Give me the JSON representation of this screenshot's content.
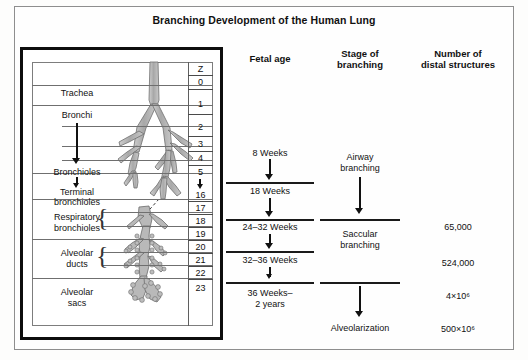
{
  "figure": {
    "title": "Branching Development of the Human Lung"
  },
  "left_panel": {
    "z_header": "Z",
    "airway_labels": [
      {
        "text": "Trachea"
      },
      {
        "text": "Bronchi"
      },
      {
        "text": "Bronchioles"
      },
      {
        "text": "Terminal\nbronchioles"
      },
      {
        "text": "Respiratory\nbronchioles"
      },
      {
        "text": "Alveolar\nducts"
      },
      {
        "text": "Alveolar\nsacs"
      }
    ],
    "label_trachea": "Trachea",
    "label_bronchi": "Bronchi",
    "label_bronchioles": "Bronchioles",
    "label_terminal_1": "Terminal",
    "label_terminal_2": "bronchioles",
    "label_resp_1": "Respiratory",
    "label_resp_2": "bronchioles",
    "label_ducts_1": "Alveolar",
    "label_ducts_2": "ducts",
    "label_sacs_1": "Alveolar",
    "label_sacs_2": "sacs",
    "generations": [
      "0",
      "1",
      "2",
      "3",
      "4",
      "5",
      "16",
      "17",
      "18",
      "19",
      "20",
      "21",
      "22",
      "23"
    ],
    "generation_gap_marker": "arrow-down-icon"
  },
  "columns": {
    "fetal_age_header": "Fetal age",
    "stage_header_line1": "Stage of",
    "stage_header_line2": "branching",
    "number_header_line1": "Number of",
    "number_header_line2": "distal structures"
  },
  "fetal_ages": [
    {
      "label": "8 Weeks"
    },
    {
      "label": "18 Weeks"
    },
    {
      "label": "24–32 Weeks"
    },
    {
      "label": "32–36 Weeks"
    },
    {
      "label": "36 Weeks–",
      "label2": "2 years"
    }
  ],
  "stages": [
    {
      "line1": "Airway",
      "line2": "branching"
    },
    {
      "line1": "Saccular",
      "line2": "branching"
    },
    {
      "line1": "Alveolarization",
      "line2": ""
    }
  ],
  "distal_structures": [
    {
      "value": "65,000",
      "mantissa": "65,000",
      "exponent": ""
    },
    {
      "value": "524,000",
      "mantissa": "524,000",
      "exponent": ""
    },
    {
      "value": "4×10⁶",
      "mantissa": "4×10",
      "exponent": "6"
    },
    {
      "value": "500×10⁶",
      "mantissa": "500×10",
      "exponent": "6"
    }
  ],
  "colors": {
    "frame": "#8e8e8e",
    "heavy_box": "#0d0d0d",
    "tree_fill": "#b9b9b9",
    "tree_stroke": "#6e6e6e",
    "text": "#111111"
  }
}
